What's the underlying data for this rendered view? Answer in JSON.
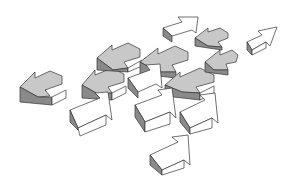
{
  "image": {
    "description": "Illustration of a scattered group of 3D block arrows; gray arrows point left, white arrows point up-right",
    "width": 293,
    "height": 189,
    "colors": {
      "background": "#ffffff",
      "arrow_top_gray": "#c8c8c8",
      "arrow_side_dark": "#8a8a8a",
      "arrow_white": "#ffffff",
      "outline": "#333333"
    },
    "arrow_count_approx": 16
  }
}
